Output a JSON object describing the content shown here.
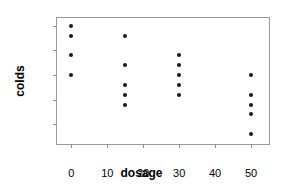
{
  "chart_data": {
    "type": "scatter",
    "title": "",
    "xlabel": "dosage",
    "ylabel": "colds",
    "xlim": [
      -4,
      55
    ],
    "ylim": [
      3.0,
      15.8
    ],
    "grid": false,
    "legend": "none",
    "xticks": [
      0,
      10,
      20,
      30,
      40,
      50
    ],
    "xtick_labels": [
      "0",
      "10",
      "20",
      "30",
      "40",
      "50"
    ],
    "yticks": [
      5.0,
      7.5,
      10.0,
      12.5,
      15.0
    ],
    "ytick_labels": [
      "5.0",
      "7.5",
      "10.0",
      "12.5",
      "15.0"
    ],
    "marker": "filled-circle",
    "marker_color": "#1a1a1a",
    "frame_color": "#9a9a9a",
    "background": "#ffffff",
    "points": [
      {
        "x": 0,
        "y": 15
      },
      {
        "x": 0,
        "y": 14
      },
      {
        "x": 0,
        "y": 12
      },
      {
        "x": 0,
        "y": 10
      },
      {
        "x": 15,
        "y": 14
      },
      {
        "x": 15,
        "y": 11
      },
      {
        "x": 15,
        "y": 9
      },
      {
        "x": 15,
        "y": 8
      },
      {
        "x": 15,
        "y": 7
      },
      {
        "x": 30,
        "y": 12
      },
      {
        "x": 30,
        "y": 11
      },
      {
        "x": 30,
        "y": 10
      },
      {
        "x": 30,
        "y": 9
      },
      {
        "x": 30,
        "y": 8
      },
      {
        "x": 50,
        "y": 10
      },
      {
        "x": 50,
        "y": 8
      },
      {
        "x": 50,
        "y": 7
      },
      {
        "x": 50,
        "y": 6
      },
      {
        "x": 50,
        "y": 4
      }
    ]
  }
}
